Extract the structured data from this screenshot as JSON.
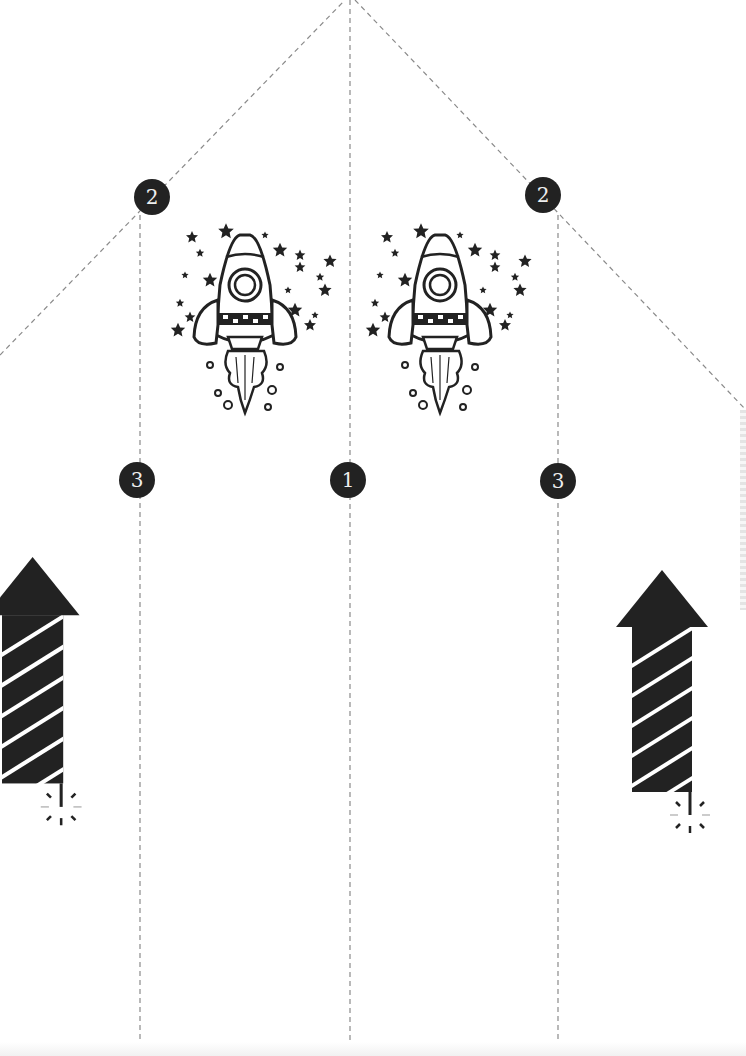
{
  "template": {
    "title": "Rocket paper fold template",
    "fold_lines": {
      "style": "dashed",
      "color": "#8a8a8a",
      "vertical_x": [
        140,
        350,
        558
      ],
      "diagonals": [
        {
          "from": [
            0,
            355
          ],
          "to": [
            345,
            0
          ]
        },
        {
          "from": [
            355,
            0
          ],
          "to": [
            746,
            410
          ]
        }
      ]
    },
    "badges": [
      {
        "label": "2",
        "x": 152,
        "y": 197
      },
      {
        "label": "2",
        "x": 543,
        "y": 195
      },
      {
        "label": "3",
        "x": 137,
        "y": 480
      },
      {
        "label": "1",
        "x": 348,
        "y": 480
      },
      {
        "label": "3",
        "x": 558,
        "y": 481
      }
    ],
    "illustrations": [
      {
        "icon": "rocket-with-stars-icon",
        "x": 170,
        "y": 225
      },
      {
        "icon": "rocket-with-stars-icon",
        "x": 365,
        "y": 225
      },
      {
        "icon": "firework-rocket-icon",
        "x": -20,
        "y": 555
      },
      {
        "icon": "firework-rocket-icon",
        "x": 612,
        "y": 568
      }
    ],
    "colors": {
      "ink": "#222222",
      "paper": "#ffffff",
      "badge_text": "#eeeeee"
    }
  }
}
